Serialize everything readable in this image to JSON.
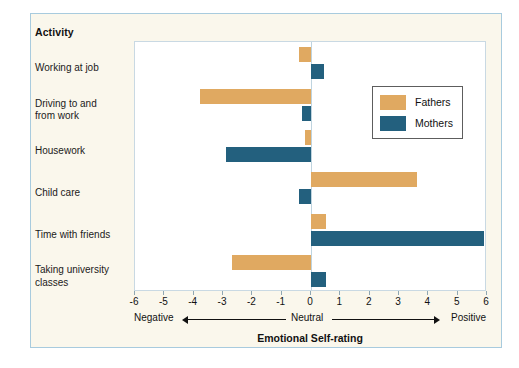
{
  "chart_data": {
    "type": "bar",
    "orientation": "horizontal",
    "title": "",
    "xlabel": "Emotional Self-rating",
    "ylabel": "Activity",
    "xlim": [
      -6,
      6
    ],
    "grid": false,
    "legend_position": "top-right",
    "xticks": [
      "-6",
      "-5",
      "-4",
      "-3",
      "-2",
      "-1",
      "0",
      "1",
      "2",
      "3",
      "4",
      "5",
      "6"
    ],
    "axis_annotations": {
      "left": "Negative",
      "center": "Neutral",
      "right": "Positive"
    },
    "categories": [
      "Working at job",
      "Driving to and from work",
      "Housework",
      "Child care",
      "Time with friends",
      "Taking university classes"
    ],
    "series": [
      {
        "name": "Fathers",
        "color": "#E0A961",
        "values": [
          -0.4,
          -3.8,
          -0.2,
          3.6,
          0.5,
          -2.7
        ]
      },
      {
        "name": "Mothers",
        "color": "#23607E",
        "values": [
          0.45,
          -0.3,
          -2.9,
          -0.4,
          5.9,
          0.5
        ]
      }
    ]
  },
  "legend": {
    "items": [
      {
        "label": "Fathers",
        "color": "#E0A961"
      },
      {
        "label": "Mothers",
        "color": "#23607E"
      }
    ]
  },
  "labels": {
    "header": "Activity",
    "categories": [
      "Working at job",
      "Driving to and\nfrom work",
      "Housework",
      "Child care",
      "Time with friends",
      "Taking university\nclasses"
    ]
  }
}
